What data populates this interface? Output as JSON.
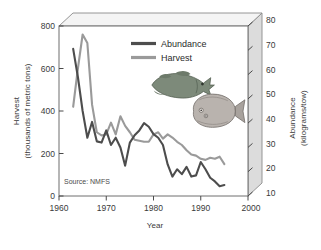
{
  "chart_data": {
    "type": "line",
    "title": "",
    "subtitle": "",
    "xlabel": "Year",
    "ylabel": "Harvest (thousands of metric tons)",
    "ylabel_line1": "Harvest",
    "ylabel_line2": "(thousands of metric tons)",
    "y2label": "Abundance (kilograms/tow)",
    "y2label_line1": "Abundance",
    "y2label_line2": "(kilograms/tow)",
    "xlim": [
      1960,
      2000
    ],
    "ylim": [
      0,
      800
    ],
    "y2lim": [
      10,
      80
    ],
    "xticks": [
      1960,
      1970,
      1980,
      1990,
      2000
    ],
    "xtick_labels": [
      "1960",
      "1970",
      "1980",
      "1990",
      "2000"
    ],
    "yticks": [
      0,
      200,
      400,
      600,
      800
    ],
    "ytick_labels": [
      "0",
      "200",
      "400",
      "600",
      "800"
    ],
    "y2ticks": [
      10,
      20,
      30,
      40,
      50,
      60,
      70,
      80
    ],
    "y2tick_labels": [
      "10",
      "20",
      "30",
      "40",
      "50",
      "60",
      "70",
      "80"
    ],
    "grid": false,
    "legend_position": "upper-center",
    "annotation": "Source: NMFS",
    "series": [
      {
        "name": "Abundance",
        "axis": "right",
        "units": "kilograms/tow",
        "color": "#4d4d4d",
        "x": [
          1963,
          1964,
          1965,
          1966,
          1967,
          1968,
          1969,
          1970,
          1971,
          1972,
          1973,
          1974,
          1975,
          1976,
          1977,
          1978,
          1979,
          1980,
          1981,
          1982,
          1983,
          1984,
          1985,
          1986,
          1987,
          1988,
          1989,
          1990,
          1991,
          1992,
          1993,
          1994,
          1995
        ],
        "values": [
          70.6,
          59.0,
          45.0,
          34.0,
          40.5,
          32.5,
          32.0,
          37.0,
          31.0,
          34.0,
          30.0,
          22.5,
          32.0,
          35.0,
          37.0,
          40.0,
          38.5,
          35.5,
          34.0,
          31.0,
          23.0,
          18.0,
          21.0,
          19.0,
          22.0,
          18.0,
          18.5,
          24.0,
          21.0,
          17.5,
          16.0,
          14.0,
          14.5
        ]
      },
      {
        "name": "Harvest",
        "axis": "left",
        "units": "thousands of metric tons",
        "color": "#9a9a9a",
        "x": [
          1963,
          1964,
          1965,
          1966,
          1967,
          1968,
          1969,
          1970,
          1971,
          1972,
          1973,
          1974,
          1975,
          1976,
          1977,
          1978,
          1979,
          1980,
          1981,
          1982,
          1983,
          1984,
          1985,
          1986,
          1987,
          1988,
          1989,
          1990,
          1991,
          1992,
          1993,
          1994,
          1995
        ],
        "values": [
          420,
          600,
          760,
          720,
          430,
          300,
          285,
          290,
          345,
          290,
          375,
          330,
          300,
          265,
          260,
          255,
          255,
          290,
          300,
          270,
          290,
          275,
          255,
          240,
          215,
          195,
          190,
          175,
          170,
          180,
          175,
          185,
          150
        ]
      }
    ],
    "illustrations": [
      {
        "name": "cod-fish-illustration",
        "species": "cod"
      },
      {
        "name": "flounder-fish-illustration",
        "species": "flounder"
      }
    ]
  },
  "legend": {
    "items": [
      {
        "label": "Abundance",
        "color": "#4d4d4d"
      },
      {
        "label": "Harvest",
        "color": "#9a9a9a"
      }
    ]
  },
  "colors": {
    "abundance": "#4d4d4d",
    "harvest": "#9a9a9a",
    "frame": "#6e6e6e",
    "panel_top": "#f2f2f2",
    "panel_right": "#d6d6d6",
    "text": "#3a3a3a"
  }
}
